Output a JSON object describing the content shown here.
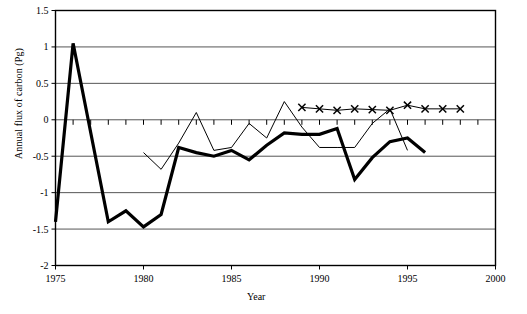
{
  "chart_data": {
    "type": "line",
    "title": "",
    "xlabel": "Year",
    "ylabel": "Annual flux of carbon (Pg)",
    "xlim": [
      1975,
      2000
    ],
    "ylim": [
      -2,
      1.5
    ],
    "xticks": [
      1975,
      1980,
      1985,
      1990,
      1995,
      2000
    ],
    "yticks": [
      1.5,
      1,
      0.5,
      0,
      -0.5,
      -1,
      -1.5,
      -2
    ],
    "xtick_labels": [
      "1975",
      "1980",
      "1985",
      "1990",
      "1995",
      "2000"
    ],
    "ytick_labels": [
      "1.5",
      "1",
      "0.5",
      "0",
      "-0.5",
      "-1",
      "-1.5",
      "-2"
    ],
    "minor_xticks_interval": 1,
    "grid": "horizontal",
    "legend": "none",
    "series": [
      {
        "name": "thick-line",
        "style": "thick-solid-no-marker",
        "color": "#000000",
        "width": 3.2,
        "x": [
          1975,
          1976,
          1978,
          1979,
          1980,
          1981,
          1982,
          1983,
          1984,
          1985,
          1986,
          1987,
          1988,
          1989,
          1990,
          1991,
          1992,
          1993,
          1994,
          1995,
          1996
        ],
        "values": [
          -1.4,
          1.05,
          -1.4,
          -1.25,
          -1.47,
          -1.3,
          -0.38,
          -0.45,
          -0.5,
          -0.42,
          -0.55,
          -0.35,
          -0.18,
          -0.2,
          -0.2,
          -0.12,
          -0.82,
          -0.52,
          -0.3,
          -0.25,
          -0.45
        ]
      },
      {
        "name": "thin-line",
        "style": "thin-solid-no-marker",
        "color": "#000000",
        "width": 1,
        "x": [
          1980,
          1981,
          1982,
          1983,
          1984,
          1985,
          1986,
          1987,
          1988,
          1989,
          1990,
          1991,
          1992,
          1993,
          1994,
          1995
        ],
        "values": [
          -0.45,
          -0.68,
          -0.32,
          0.1,
          -0.42,
          -0.38,
          -0.05,
          -0.25,
          0.25,
          -0.1,
          -0.38,
          -0.38,
          -0.38,
          -0.05,
          0.15,
          -0.42
        ]
      },
      {
        "name": "x-marker-line",
        "style": "thin-solid-x-marker",
        "color": "#000000",
        "width": 1,
        "marker": "x",
        "x": [
          1989,
          1990,
          1991,
          1992,
          1993,
          1994,
          1995,
          1996,
          1997,
          1998
        ],
        "values": [
          0.17,
          0.15,
          0.13,
          0.15,
          0.14,
          0.13,
          0.2,
          0.15,
          0.15,
          0.15
        ]
      }
    ]
  }
}
